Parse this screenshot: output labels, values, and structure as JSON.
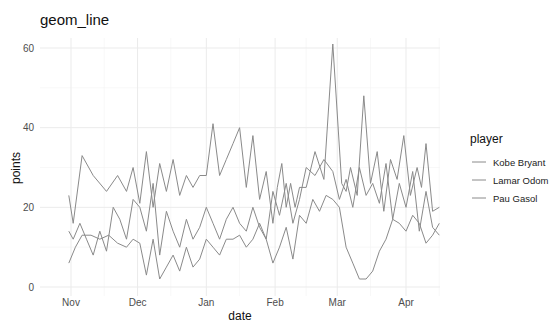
{
  "chart_data": {
    "type": "line",
    "title": "geom_line",
    "xlabel": "date",
    "ylabel": "points",
    "ylim": [
      0,
      62
    ],
    "y_ticks": [
      0,
      20,
      40,
      60
    ],
    "x_ticks": [
      "Nov",
      "Dec",
      "Jan",
      "Feb",
      "Mar",
      "Apr"
    ],
    "grid": true,
    "legend": {
      "title": "player",
      "position": "right",
      "entries": [
        "Kobe Bryant",
        "Lamar Odom",
        "Pau Gasol"
      ]
    },
    "x_unit": "days since Nov 1",
    "series": [
      {
        "name": "Kobe Bryant",
        "x": [
          -1,
          1,
          5,
          10,
          16,
          21,
          25,
          28,
          31,
          34,
          37,
          40,
          43,
          46,
          49,
          52,
          55,
          58,
          61,
          64,
          67,
          70,
          73,
          76,
          79,
          82,
          85,
          88,
          91,
          93,
          95,
          97,
          99,
          101,
          103,
          106,
          110,
          114,
          118,
          122,
          124,
          126,
          129,
          132,
          135,
          138,
          141,
          144,
          147,
          150,
          153,
          156,
          158,
          160,
          163,
          166
        ],
        "values": [
          23,
          16,
          33,
          28,
          24,
          28,
          24,
          30,
          21,
          34,
          20,
          31,
          24,
          32,
          23,
          28,
          25,
          28,
          28,
          41,
          28,
          32,
          36,
          40,
          25,
          38,
          22,
          29,
          16,
          25,
          31,
          20,
          26,
          20,
          25,
          25,
          34,
          27,
          61,
          26,
          24,
          30,
          23,
          48,
          26,
          34,
          19,
          32,
          27,
          38,
          23,
          30,
          25,
          36,
          19,
          20
        ]
      },
      {
        "name": "Lamar Odom",
        "x": [
          -1,
          1,
          4,
          7,
          10,
          13,
          16,
          19,
          22,
          25,
          28,
          31,
          34,
          37,
          40,
          43,
          46,
          49,
          52,
          55,
          58,
          61,
          64,
          67,
          70,
          73,
          76,
          79,
          82,
          85,
          88,
          91,
          94,
          97,
          100,
          103,
          106,
          110,
          114,
          118,
          121,
          124,
          127,
          130,
          133,
          136,
          139,
          142,
          145,
          148,
          151,
          154,
          157,
          160,
          163,
          166
        ],
        "values": [
          14,
          12,
          16,
          12,
          8,
          14,
          9,
          20,
          17,
          12,
          22,
          20,
          14,
          26,
          8,
          19,
          14,
          10,
          17,
          12,
          15,
          20,
          16,
          12,
          17,
          20,
          16,
          14,
          20,
          15,
          12,
          24,
          18,
          26,
          16,
          22,
          30,
          28,
          32,
          29,
          22,
          27,
          20,
          30,
          23,
          26,
          21,
          31,
          17,
          26,
          20,
          29,
          14,
          24,
          15,
          13
        ]
      },
      {
        "name": "Pau Gasol",
        "x": [
          -1,
          2,
          5,
          9,
          13,
          17,
          21,
          25,
          28,
          31,
          34,
          37,
          40,
          43,
          46,
          49,
          52,
          55,
          58,
          61,
          64,
          67,
          70,
          73,
          76,
          79,
          82,
          85,
          88,
          91,
          94,
          97,
          100,
          103,
          106,
          109,
          112,
          115,
          118,
          121,
          124,
          127,
          130,
          133,
          136,
          139,
          142,
          145,
          148,
          151,
          154,
          157,
          160,
          163,
          166
        ],
        "values": [
          6,
          10,
          13,
          13,
          12,
          13,
          11,
          10,
          12,
          11,
          3,
          12,
          2,
          5,
          8,
          4,
          10,
          5,
          7,
          12,
          10,
          8,
          12,
          12,
          13,
          10,
          12,
          16,
          12,
          6,
          10,
          15,
          7,
          18,
          16,
          22,
          19,
          23,
          22,
          20,
          10,
          6,
          2,
          2,
          4,
          9,
          12,
          17,
          16,
          14,
          18,
          16,
          11,
          13,
          16
        ]
      }
    ]
  },
  "legend": {
    "title": "player",
    "items": [
      "Kobe Bryant",
      "Lamar Odom",
      "Pau Gasol"
    ]
  }
}
